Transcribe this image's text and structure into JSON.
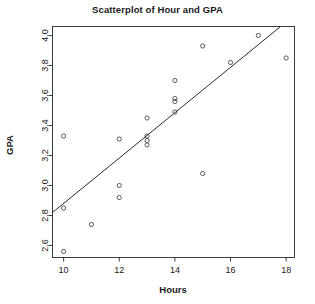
{
  "chart_data": {
    "type": "scatter",
    "title": "Scatterplot of Hour and GPA",
    "xlabel": "Hours",
    "ylabel": "GPA",
    "xlim": [
      9.6,
      18.3
    ],
    "ylim": [
      2.52,
      4.06
    ],
    "xticks": [
      10,
      12,
      14,
      16,
      18
    ],
    "yticks": [
      2.6,
      2.8,
      3.0,
      3.2,
      3.4,
      3.6,
      3.8,
      4.0
    ],
    "xtick_labels": [
      "10",
      "12",
      "14",
      "16",
      "18"
    ],
    "ytick_labels": [
      "2.6",
      "2.8",
      "3.0",
      "3.2",
      "3.4",
      "3.6",
      "3.8",
      "4.0"
    ],
    "grid": false,
    "legend": "none",
    "marker": "open-circle",
    "marker_color": "#4a4a4a",
    "points": [
      {
        "x": 10,
        "y": 3.33
      },
      {
        "x": 10,
        "y": 2.85
      },
      {
        "x": 10,
        "y": 2.56
      },
      {
        "x": 11,
        "y": 2.74
      },
      {
        "x": 12,
        "y": 3.31
      },
      {
        "x": 12,
        "y": 3.0
      },
      {
        "x": 12,
        "y": 2.92
      },
      {
        "x": 13,
        "y": 3.45
      },
      {
        "x": 13,
        "y": 3.33
      },
      {
        "x": 13,
        "y": 3.3
      },
      {
        "x": 13,
        "y": 3.27
      },
      {
        "x": 14,
        "y": 3.7
      },
      {
        "x": 14,
        "y": 3.58
      },
      {
        "x": 14,
        "y": 3.56
      },
      {
        "x": 14,
        "y": 3.49
      },
      {
        "x": 15,
        "y": 3.93
      },
      {
        "x": 15,
        "y": 3.08
      },
      {
        "x": 16,
        "y": 3.82
      },
      {
        "x": 17,
        "y": 4.0
      },
      {
        "x": 18,
        "y": 3.85
      }
    ],
    "trendline": {
      "type": "linear-fit",
      "color": "#2b2b2b",
      "x_start": 9.6,
      "y_start": 2.82,
      "x_end": 17.8,
      "y_end": 4.06
    }
  }
}
